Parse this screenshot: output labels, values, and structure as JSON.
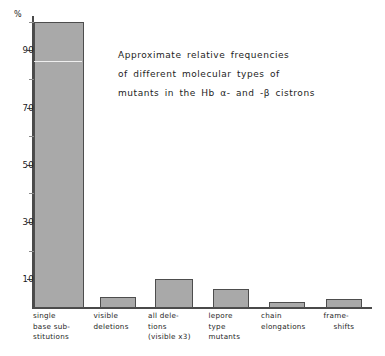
{
  "chart_data": {
    "type": "bar",
    "title": "",
    "annotation": [
      "Approximate relative frequencies",
      "of different molecular types of",
      "mutants in the  Hb α- and -β cistrons"
    ],
    "categories": [
      "single base substitutions",
      "visible deletions",
      "all deletions (visible x3)",
      "lepore type mutants",
      "chain elongations",
      "frameshifts"
    ],
    "category_label_lines": [
      [
        "single",
        "base sub-",
        "stitutions"
      ],
      [
        "visible",
        "deletions"
      ],
      [
        "all dele-",
        "tions",
        "(visible x3)"
      ],
      [
        "lepore",
        "type",
        "mutants"
      ],
      [
        "chain",
        "elongations"
      ],
      [
        "frame-",
        "shifts"
      ]
    ],
    "values": [
      100,
      4,
      10,
      6.5,
      2,
      3
    ],
    "xlabel": "",
    "ylabel": "%",
    "ylim": [
      0,
      102
    ],
    "ytick_values": [
      10,
      30,
      50,
      70,
      90
    ],
    "ytick_labels": [
      "10",
      "30",
      "50",
      "70",
      "90"
    ],
    "yminor_values": [
      20,
      40,
      60,
      80,
      100
    ],
    "grid": false,
    "legend": false,
    "bar_fill_color": "#a9a9a9",
    "bar_edge_color": "#4d4d4d",
    "axis_color": "#4a4a4a",
    "background_color": "#ffffff"
  }
}
